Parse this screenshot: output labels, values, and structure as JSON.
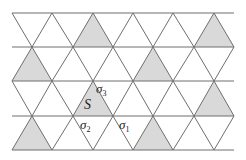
{
  "diagram": {
    "title": "",
    "type": "triangular-lattice",
    "colors": {
      "line": "#6e6e6e",
      "shade": "#d9d9d9",
      "background": "#ffffff",
      "text": "#222222"
    },
    "geometry": {
      "row_y": [
        13,
        47,
        81,
        116,
        150
      ],
      "x_left": 12,
      "x_right": 234,
      "even_row_vertices_x": [
        12,
        52,
        93,
        133,
        173,
        214
      ],
      "odd_row_vertices_x": [
        32,
        73,
        113,
        153,
        194,
        234
      ]
    },
    "shaded_triangles": [
      {
        "points": "93,13 73,47 113,47"
      },
      {
        "points": "214,13 194,47 234,47"
      },
      {
        "points": "32,47 12,81 52,81"
      },
      {
        "points": "153,47 133,81 173,81"
      },
      {
        "points": "93,81 73,116 113,116",
        "label": "S"
      },
      {
        "points": "214,81 194,116 234,116"
      },
      {
        "points": "32,116 12,150 52,150"
      },
      {
        "points": "153,116 133,150 173,150"
      }
    ],
    "labels": {
      "S": "S",
      "sigma3": {
        "base": "σ",
        "sub": "3"
      },
      "sigma2": {
        "base": "σ",
        "sub": "2"
      },
      "sigma1": {
        "base": "σ",
        "sub": "1"
      }
    }
  }
}
